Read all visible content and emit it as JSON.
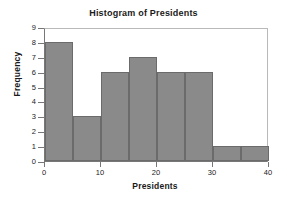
{
  "chart_data": {
    "type": "bar",
    "title": "Histogram of Presidents",
    "xlabel": "Presidents",
    "ylabel": "Frequency",
    "bin_width": 5,
    "bin_edges": [
      0,
      5,
      10,
      15,
      20,
      25,
      30,
      35,
      40
    ],
    "categories": [
      "0-5",
      "5-10",
      "10-15",
      "15-20",
      "20-25",
      "25-30",
      "30-35",
      "35-40"
    ],
    "bin_centers": [
      2.5,
      7.5,
      12.5,
      17.5,
      22.5,
      27.5,
      32.5,
      37.5
    ],
    "values": [
      8,
      3,
      6,
      7,
      6,
      6,
      1,
      1
    ],
    "xlim": [
      0,
      40
    ],
    "ylim": [
      0,
      9
    ],
    "xticks": [
      0,
      10,
      20,
      30,
      40
    ],
    "yticks": [
      0,
      1,
      2,
      3,
      4,
      5,
      6,
      7,
      8,
      9
    ],
    "xtick_labels": [
      "0",
      "10",
      "20",
      "30",
      "40"
    ],
    "ytick_labels": [
      "0",
      "1",
      "2",
      "3",
      "4",
      "5",
      "6",
      "7",
      "8",
      "9"
    ],
    "grid": false,
    "legend": false,
    "bar_color": "#8a8a8a",
    "bar_edge_color": "#6b6b6b",
    "plot_border_color": "#b9b9b9",
    "axis_color": "#777777",
    "text_color": "#1a1a1a",
    "background_color": "#ffffff"
  }
}
